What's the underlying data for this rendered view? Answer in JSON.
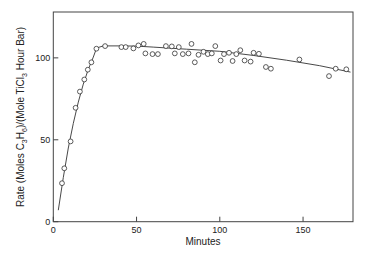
{
  "chart_data": {
    "type": "scatter",
    "title": "",
    "xlabel": "Minutes",
    "ylabel": "Rate (Moles C3H6)/(Mole TiCl3 Hour Bar)",
    "ylabel_parts": {
      "prefix": "Rate (Moles  C",
      "sub1": "3",
      "mid1": "H",
      "sub2": "6",
      "mid2": ")/(Mole TiCl",
      "sub3": "3",
      "suffix": "  Hour Bar)"
    },
    "xlim": [
      0,
      180
    ],
    "ylim": [
      0,
      128
    ],
    "xticks": [
      0,
      50,
      100,
      150
    ],
    "yticks": [
      0,
      50,
      100
    ],
    "xtick_labels": [
      "0",
      "50",
      "100",
      "150"
    ],
    "ytick_labels": [
      "0",
      "50",
      "100"
    ],
    "grid": false,
    "legend": null,
    "series": [
      {
        "name": "Measured rate",
        "style": "open-circle markers",
        "x": [
          5.2,
          6.6,
          10.4,
          13.4,
          16,
          18.6,
          20.7,
          22.9,
          25.9,
          31.1,
          40.9,
          43.5,
          48.1,
          51.1,
          54.3,
          55.3,
          59.6,
          62.8,
          67.6,
          71.2,
          73,
          75.4,
          77.8,
          81.2,
          83,
          85,
          87.2,
          90.2,
          92.8,
          95.2,
          97.3,
          100.5,
          102.5,
          105.5,
          107.7,
          109.9,
          112.3,
          114.9,
          118.5,
          120.3,
          123.5,
          127.7,
          130.7,
          147.8,
          165.6,
          169.6,
          176
        ],
        "y": [
          23.5,
          32.6,
          49,
          69.5,
          79.4,
          86.8,
          92.8,
          97.3,
          105.6,
          107.2,
          106.6,
          106.6,
          105.8,
          107.6,
          108.5,
          102.7,
          102.3,
          102.3,
          107.2,
          107,
          102.7,
          106.6,
          102.3,
          102.7,
          108.5,
          97.3,
          101.9,
          103.7,
          102.3,
          102.7,
          107.2,
          98.4,
          102.3,
          103.1,
          98.1,
          102.3,
          104.7,
          98.4,
          97.7,
          103.1,
          102.5,
          94.4,
          93.4,
          99,
          88.9,
          93.4,
          93
        ]
      },
      {
        "name": "Fitted curve",
        "style": "solid line",
        "x": [
          3,
          6,
          9,
          12,
          15,
          18,
          21,
          24,
          26,
          30,
          40,
          50,
          60,
          80,
          100,
          120,
          140,
          160,
          178.5
        ],
        "y": [
          7,
          27,
          45,
          60,
          73,
          84,
          93,
          100.5,
          106,
          107.3,
          107.3,
          107.2,
          106.6,
          105.3,
          104,
          101.5,
          98.6,
          95.2,
          91.3
        ]
      }
    ]
  }
}
